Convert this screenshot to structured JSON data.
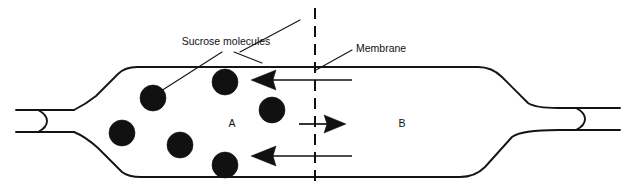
{
  "diagram": {
    "labels": {
      "sucrose": "Sucrose molecules",
      "membrane": "Membrane",
      "region_a": "A",
      "region_b": "B"
    },
    "colors": {
      "ink": "#111111",
      "outline": "#141414",
      "background": "#ffffff"
    },
    "regions": [
      {
        "id": "a",
        "label": "A",
        "x": 232,
        "y": 123,
        "contents": "sucrose solution"
      },
      {
        "id": "b",
        "label": "B",
        "x": 402,
        "y": 123,
        "contents": "water"
      }
    ],
    "membrane": {
      "label": "Membrane",
      "x": 315,
      "y_top": 8,
      "y_bottom": 186,
      "style": "dashed"
    },
    "molecules": {
      "label": "Sucrose molecules",
      "count": 7,
      "radius": 13,
      "positions": [
        {
          "cx": 153,
          "cy": 98
        },
        {
          "cx": 225,
          "cy": 82
        },
        {
          "cx": 272,
          "cy": 110
        },
        {
          "cx": 122,
          "cy": 133
        },
        {
          "cx": 180,
          "cy": 145
        },
        {
          "cx": 225,
          "cy": 165
        },
        {
          "cx": 262,
          "cy": 63
        }
      ]
    },
    "flow_arrows": [
      {
        "id": "water-in-top",
        "direction": "left",
        "from_x": 352,
        "to_x": 251,
        "y": 80
      },
      {
        "id": "sucrose-blocked",
        "direction": "right",
        "from_x": 299,
        "to_x": 346,
        "y": 124
      },
      {
        "id": "water-in-bottom",
        "direction": "left",
        "from_x": 352,
        "to_x": 251,
        "y": 156
      }
    ],
    "callouts": [
      {
        "id": "sucrose",
        "text": "Sucrose molecules",
        "text_x": 226,
        "text_y": 45
      },
      {
        "id": "membrane",
        "text": "Membrane",
        "text_x": 356,
        "text_y": 52
      }
    ]
  }
}
